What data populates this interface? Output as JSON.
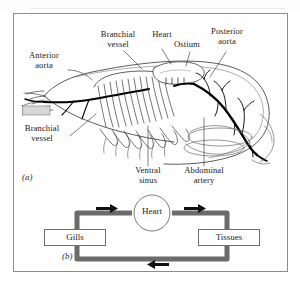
{
  "figure": {
    "panel_a": {
      "tag": "(a)",
      "subject": "crustacean-circulatory-system",
      "labels": [
        {
          "id": "branchial-vessel-top",
          "text": "Branchial\nvessel"
        },
        {
          "id": "heart",
          "text": "Heart"
        },
        {
          "id": "ostium",
          "text": "Ostium"
        },
        {
          "id": "posterior-aorta",
          "text": "Posterior\naorta"
        },
        {
          "id": "anterior-aorta",
          "text": "Anterior\naorta"
        },
        {
          "id": "branchial-vessel-bottom",
          "text": "Branchial\nvessel"
        },
        {
          "id": "ventral-sinus",
          "text": "Ventral\nsinus"
        },
        {
          "id": "abdominal-artery",
          "text": "Abdominal\nartery"
        }
      ]
    },
    "panel_b": {
      "tag": "(b)",
      "nodes": [
        {
          "id": "gills",
          "text": "Gills",
          "shape": "box"
        },
        {
          "id": "heart",
          "text": "Heart",
          "shape": "circle"
        },
        {
          "id": "tissues",
          "text": "Tissues",
          "shape": "box"
        }
      ],
      "flow": [
        {
          "from": "gills",
          "to": "heart",
          "direction": "right"
        },
        {
          "from": "heart",
          "to": "tissues",
          "direction": "right"
        },
        {
          "from": "tissues",
          "to": "gills",
          "direction": "left"
        }
      ]
    }
  },
  "colors": {
    "ink": "#1c1c1c",
    "frame": "#8d8d8d",
    "line_art": "#3a3a3a",
    "vessel_dark": "#000000",
    "circuit_gray": "#6b6b6b",
    "paper": "#fefefe"
  }
}
